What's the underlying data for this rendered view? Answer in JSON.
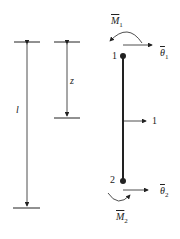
{
  "diagram": {
    "dimension_l": "l",
    "dimension_z": "z",
    "node_top": "1",
    "node_bottom": "2",
    "load_label": "1",
    "moment_top": {
      "symbol": "M",
      "sub": "1"
    },
    "rotation_top": {
      "symbol": "θ",
      "sub": "1"
    },
    "moment_bottom": {
      "symbol": "M",
      "sub": "2"
    },
    "rotation_bottom": {
      "symbol": "θ",
      "sub": "2"
    }
  }
}
